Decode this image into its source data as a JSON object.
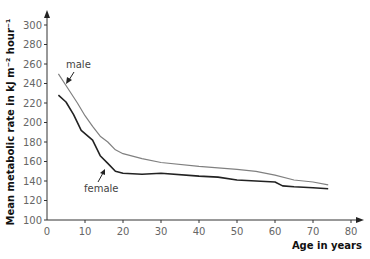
{
  "chart_data": {
    "type": "line",
    "title": "",
    "xlabel": "Age in years",
    "ylabel": "Mean metabolic rate  in kJ m⁻² hour⁻¹",
    "xlim": [
      0,
      80
    ],
    "ylim": [
      100,
      300
    ],
    "x_ticks": [
      0,
      10,
      20,
      30,
      40,
      50,
      60,
      70,
      80
    ],
    "y_ticks": [
      100,
      120,
      140,
      160,
      180,
      200,
      220,
      240,
      260,
      280,
      300
    ],
    "grid": false,
    "legend": "inline annotations",
    "series": [
      {
        "name": "male",
        "color": "#808080",
        "x": [
          3,
          5,
          8,
          10,
          12,
          14,
          16,
          18,
          20,
          25,
          30,
          40,
          50,
          55,
          60,
          65,
          70,
          74
        ],
        "y": [
          250,
          238,
          220,
          207,
          196,
          186,
          180,
          172,
          168,
          163,
          159,
          155,
          152,
          150,
          146,
          141,
          139,
          136
        ]
      },
      {
        "name": "female",
        "color": "#222222",
        "x": [
          3,
          5,
          7,
          9,
          12,
          14,
          16,
          18,
          20,
          25,
          30,
          40,
          45,
          50,
          55,
          60,
          62,
          65,
          70,
          74
        ],
        "y": [
          228,
          221,
          208,
          192,
          182,
          166,
          158,
          150,
          148,
          147,
          148,
          145,
          144,
          141,
          140,
          139,
          135,
          134,
          133,
          132
        ]
      }
    ],
    "annotations": [
      {
        "text": "male",
        "x": 7,
        "y": 262
      },
      {
        "text": "female",
        "x": 18,
        "y": 128
      }
    ]
  },
  "labels": {
    "xlabel": "Age in years",
    "ylabel": "Mean metabolic rate  in kJ m⁻² hour⁻¹",
    "male": "male",
    "female": "female"
  }
}
